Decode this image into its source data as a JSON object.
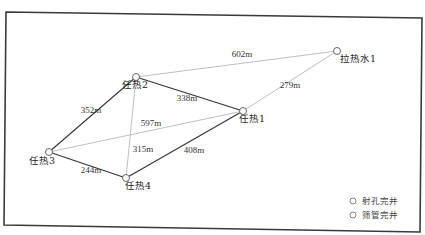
{
  "diagram": {
    "frame": {
      "stroke": "#3a3a3a"
    },
    "colors": {
      "strong_edge": "#333333",
      "weak_edge": "#b8b8b8",
      "node": "#555555",
      "text": "#222222"
    },
    "nodes": [
      {
        "id": "rr2",
        "label": "任热2",
        "x": 136,
        "y": 77,
        "lx": 135,
        "ly": 88
      },
      {
        "id": "lrs1",
        "label": "拉热水1",
        "x": 337,
        "y": 51,
        "lx": 358,
        "ly": 62
      },
      {
        "id": "rr1",
        "label": "任热1",
        "x": 243,
        "y": 111,
        "lx": 252,
        "ly": 122
      },
      {
        "id": "rr3",
        "label": "任热3",
        "x": 49,
        "y": 152,
        "lx": 42,
        "ly": 164
      },
      {
        "id": "rr4",
        "label": "任热4",
        "x": 126,
        "y": 178,
        "lx": 138,
        "ly": 189
      }
    ],
    "edges": [
      {
        "from": "rr2",
        "to": "rr1",
        "label": "338m",
        "weight": "strong",
        "lx": 187,
        "ly": 101
      },
      {
        "from": "rr2",
        "to": "rr3",
        "label": "352m",
        "weight": "strong",
        "lx": 91,
        "ly": 113
      },
      {
        "from": "rr3",
        "to": "rr4",
        "label": "244m",
        "weight": "strong",
        "lx": 91,
        "ly": 173
      },
      {
        "from": "rr4",
        "to": "rr1",
        "label": "408m",
        "weight": "strong",
        "lx": 194,
        "ly": 153
      },
      {
        "from": "rr2",
        "to": "lrs1",
        "label": "602m",
        "weight": "weak",
        "lx": 242,
        "ly": 57
      },
      {
        "from": "rr1",
        "to": "lrs1",
        "label": "279m",
        "weight": "weak",
        "lx": 290,
        "ly": 88
      },
      {
        "from": "rr3",
        "to": "rr1",
        "label": "597m",
        "weight": "weak",
        "lx": 151,
        "ly": 126
      },
      {
        "from": "rr2",
        "to": "rr4",
        "label": "315m",
        "weight": "weak",
        "lx": 143,
        "ly": 152
      }
    ],
    "legend": [
      {
        "symbol": "circle",
        "label": "射孔完井"
      },
      {
        "symbol": "circle",
        "label": "筛管完井"
      }
    ]
  }
}
